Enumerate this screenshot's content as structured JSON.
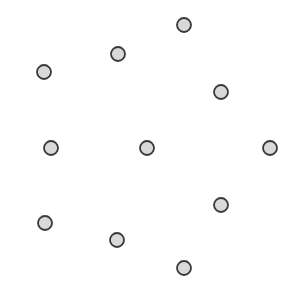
{
  "canvas": {
    "width": 292,
    "height": 292,
    "background_color": "#ffffff",
    "title": ""
  },
  "marker_style": {
    "shape": "circle",
    "radius": 7,
    "fill_color": "#d9d9d9",
    "stroke_color": "#3a3a3a",
    "stroke_width": 1.8,
    "icon_name": "circle-marker-icon"
  },
  "chart_data": {
    "type": "scatter",
    "title": "",
    "xlabel": "",
    "ylabel": "",
    "xlim": [
      0,
      292
    ],
    "ylim": [
      0,
      292
    ],
    "grid": false,
    "legend": null,
    "axes_visible": false,
    "tick_labels_visible": false,
    "point_count": 12,
    "marker_shape": "circle",
    "marker_fill": "#d9d9d9",
    "marker_stroke": "#3a3a3a",
    "series": [
      {
        "name": "points",
        "points": [
          {
            "id": "p1",
            "label": "top",
            "x": 184,
            "y": 25
          },
          {
            "id": "p2",
            "label": "upper-left-in",
            "x": 118,
            "y": 54
          },
          {
            "id": "p3",
            "label": "upper-left-out",
            "x": 44,
            "y": 72
          },
          {
            "id": "p4",
            "label": "upper-right",
            "x": 221,
            "y": 92
          },
          {
            "id": "p5",
            "label": "mid-left",
            "x": 51,
            "y": 148
          },
          {
            "id": "p6",
            "label": "center",
            "x": 147,
            "y": 148
          },
          {
            "id": "p7",
            "label": "mid-right",
            "x": 270,
            "y": 148
          },
          {
            "id": "p8",
            "label": "lower-right",
            "x": 221,
            "y": 205
          },
          {
            "id": "p9",
            "label": "lower-left-out",
            "x": 45,
            "y": 223
          },
          {
            "id": "p10",
            "label": "lower-left-in",
            "x": 117,
            "y": 240
          },
          {
            "id": "p11",
            "label": "bottom",
            "x": 184,
            "y": 268
          }
        ]
      }
    ]
  }
}
